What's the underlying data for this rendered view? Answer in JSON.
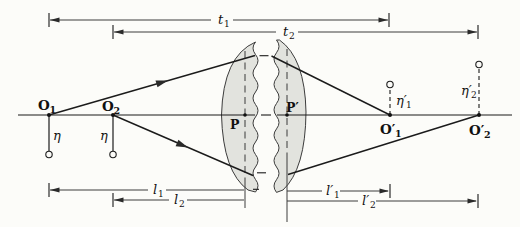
{
  "labels": {
    "t1": {
      "base": "t",
      "sub": "1"
    },
    "t2": {
      "base": "t",
      "sub": "2"
    },
    "l1": {
      "base": "l",
      "sub": "1"
    },
    "l2": {
      "base": "l",
      "sub": "2"
    },
    "l1_prime": {
      "base": "l′",
      "sub": "1"
    },
    "l2_prime": {
      "base": "l′",
      "sub": "2"
    },
    "O1": {
      "base": "O",
      "sub": "1"
    },
    "O2": {
      "base": "O",
      "sub": "2"
    },
    "O1_prime": {
      "base": "O′",
      "sub": "1"
    },
    "O2_prime": {
      "base": "O′",
      "sub": "2"
    },
    "eta1": {
      "base": "η"
    },
    "eta2": {
      "base": "η"
    },
    "eta1_prime": {
      "base": "η′",
      "sub": "1"
    },
    "eta2_prime": {
      "base": "η′",
      "sub": "2"
    },
    "P": {
      "base": "P"
    },
    "P_prime": {
      "base": "P′"
    }
  },
  "colors": {
    "background": "#fcfcf9",
    "line": "#1b1b1b",
    "dimension_line": "#3d3d3d",
    "lens_fill": "#e2e3de",
    "lens_stroke": "#3c3c3c"
  }
}
